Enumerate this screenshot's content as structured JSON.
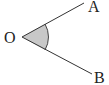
{
  "diagram": {
    "type": "angle",
    "vertex": {
      "label": "O"
    },
    "rays": [
      {
        "label": "A"
      },
      {
        "label": "B"
      }
    ],
    "shaded_angle": "AOB",
    "colors": {
      "line": "#333333",
      "fill": "#c8c8c8"
    }
  }
}
